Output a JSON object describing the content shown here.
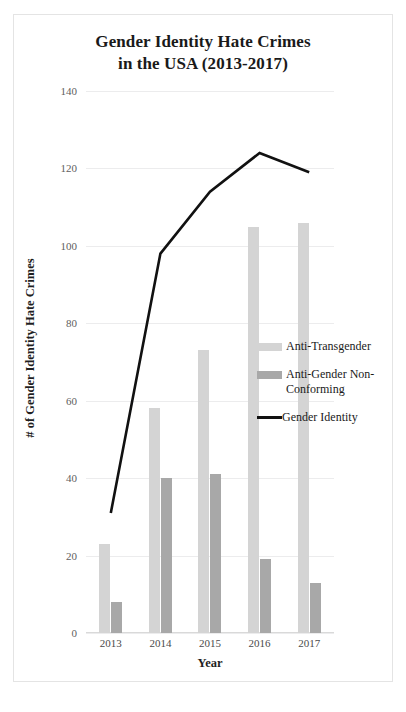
{
  "chart_data": {
    "type": "bar",
    "title": "Gender Identity Hate Crimes in the USA (2013-2017)",
    "title_line1": "Gender Identity Hate Crimes",
    "title_line2": "in the USA (2013-2017)",
    "xlabel": "Year",
    "ylabel": "# of Gender Identity Hate Crimes",
    "categories": [
      "2013",
      "2014",
      "2015",
      "2016",
      "2017"
    ],
    "ylim": [
      0,
      140
    ],
    "yticks": [
      0,
      20,
      40,
      60,
      80,
      100,
      120,
      140
    ],
    "grid": true,
    "legend_position": "right",
    "series": [
      {
        "name": "Anti-Transgender",
        "type": "bar",
        "color": "#d4d4d4",
        "values": [
          23,
          58,
          73,
          105,
          106
        ]
      },
      {
        "name": "Anti-Gender Non-Conforming",
        "type": "bar",
        "color": "#a8a8a8",
        "values": [
          8,
          40,
          41,
          19,
          13
        ]
      },
      {
        "name": "Gender Identity",
        "type": "line",
        "color": "#111111",
        "values": [
          31,
          98,
          114,
          124,
          119
        ]
      }
    ]
  },
  "legend": {
    "items": [
      {
        "label": "Anti-Transgender",
        "swatch": "bar-swatch-light"
      },
      {
        "label": "Anti-Gender Non-Conforming",
        "swatch": "bar-swatch-dark"
      },
      {
        "label": "Gender Identity",
        "swatch": "line-swatch-black"
      }
    ]
  },
  "page_mark": ""
}
